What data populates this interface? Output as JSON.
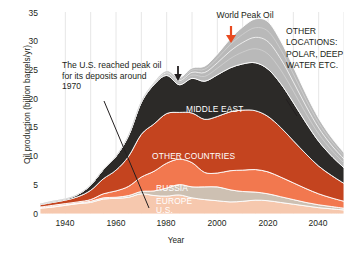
{
  "chart_data": {
    "type": "area",
    "title": "",
    "xlabel": "Year",
    "ylabel": "Oil production (billion barrels/yr)",
    "xlim": [
      1930,
      2050
    ],
    "ylim": [
      0,
      35
    ],
    "grid": "vertical",
    "legend_position": "inline-labels",
    "xticks": [
      "1940",
      "1960",
      "1980",
      "2000",
      "2020",
      "2040"
    ],
    "xtick_values": [
      1940,
      1960,
      1980,
      2000,
      2020,
      2040
    ],
    "yticks": [
      "0",
      "5",
      "10",
      "15",
      "20",
      "25",
      "30",
      "35"
    ],
    "ytick_values": [
      0,
      5,
      10,
      15,
      20,
      25,
      30,
      35
    ],
    "x": [
      1930,
      1935,
      1940,
      1945,
      1950,
      1955,
      1960,
      1965,
      1970,
      1975,
      1980,
      1985,
      1990,
      1995,
      2000,
      2005,
      2010,
      2015,
      2020,
      2025,
      2030,
      2035,
      2040,
      2045,
      2050
    ],
    "stacked": true,
    "series": [
      {
        "name": "U.S.",
        "color": "#f6c8ae",
        "values": [
          1.0,
          1.2,
          1.5,
          1.8,
          2.0,
          2.6,
          2.7,
          2.9,
          3.5,
          3.2,
          3.1,
          3.3,
          2.8,
          2.5,
          2.3,
          2.1,
          2.2,
          2.4,
          2.3,
          2.0,
          1.7,
          1.4,
          1.1,
          0.9,
          0.7
        ]
      },
      {
        "name": "EUROPE",
        "color": "#cdc0b2",
        "values": [
          0.1,
          0.1,
          0.1,
          0.1,
          0.2,
          0.2,
          0.2,
          0.3,
          0.4,
          0.8,
          1.4,
          1.8,
          1.9,
          2.2,
          2.4,
          2.1,
          1.7,
          1.4,
          1.2,
          1.0,
          0.8,
          0.6,
          0.5,
          0.4,
          0.3
        ]
      },
      {
        "name": "RUSSIA",
        "color": "#f2784f",
        "values": [
          0.1,
          0.2,
          0.2,
          0.2,
          0.3,
          0.7,
          1.1,
          1.6,
          2.5,
          3.4,
          4.3,
          4.4,
          4.2,
          2.5,
          2.4,
          3.3,
          3.7,
          3.9,
          3.8,
          3.4,
          2.9,
          2.4,
          1.9,
          1.5,
          1.2
        ]
      },
      {
        "name": "OTHER COUNTRIES",
        "color": "#c4441f",
        "values": [
          0.4,
          0.5,
          0.6,
          0.9,
          1.6,
          2.6,
          3.6,
          5.2,
          7.4,
          8.2,
          8.6,
          8.1,
          8.6,
          9.2,
          9.8,
          10.2,
          10.4,
          10.2,
          9.6,
          8.6,
          7.3,
          6.0,
          4.8,
          3.9,
          3.1
        ]
      },
      {
        "name": "MIDDLE EAST",
        "color": "#2c2a28",
        "values": [
          0.1,
          0.2,
          0.2,
          0.4,
          0.9,
          1.6,
          2.4,
          3.6,
          5.5,
          6.8,
          6.6,
          4.8,
          6.0,
          6.6,
          7.2,
          7.6,
          8.0,
          8.3,
          8.2,
          7.6,
          6.6,
          5.4,
          4.3,
          3.4,
          2.7
        ]
      },
      {
        "name": "OTHER LOCATIONS: POLAR, DEEP WATER ETC.",
        "color": "#b9b9b9",
        "values": [
          0.0,
          0.0,
          0.0,
          0.0,
          0.0,
          0.0,
          0.0,
          0.1,
          0.2,
          0.4,
          0.8,
          1.2,
          1.8,
          2.6,
          3.6,
          5.0,
          6.4,
          7.6,
          8.2,
          7.4,
          6.2,
          5.0,
          4.0,
          3.2,
          2.6
        ]
      }
    ],
    "peak_total": 31.2,
    "peak_year": 2008
  },
  "annotations": {
    "us_peak": "The U.S. reached peak oil for its deposits around 1970",
    "world_peak": "World Peak Oil",
    "other_locations": "OTHER LOCATIONS: POLAR, DEEP WATER ETC.",
    "world_peak_arrow_color": "#e8491f",
    "mideast_arrow_color": "#231f20"
  },
  "layer_labels": {
    "middle_east": "MIDDLE EAST",
    "other_countries": "OTHER COUNTRIES",
    "russia": "RUSSIA",
    "europe": "EUROPE",
    "us": "U.S."
  }
}
